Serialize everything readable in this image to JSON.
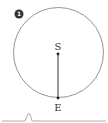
{
  "diagram": {
    "badge_number": "1",
    "circle": {
      "cx": 58.5,
      "cy": 52.5,
      "r": 45,
      "stroke": "#888888"
    },
    "points": [
      {
        "label": "S",
        "x": 58,
        "y": 54
      },
      {
        "label": "E",
        "x": 58,
        "y": 98
      }
    ],
    "segment": {
      "from": "S",
      "to": "E",
      "stroke": "#333333"
    },
    "baseline": {
      "y": 121,
      "peak_x": 29,
      "peak_y": 113,
      "stroke": "#999999"
    }
  }
}
